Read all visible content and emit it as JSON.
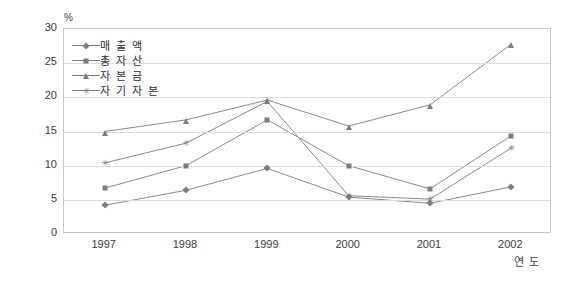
{
  "chart_data": {
    "type": "line",
    "title": "",
    "xlabel": "연도",
    "ylabel": "%",
    "unit_label": "%",
    "categories": [
      "1997",
      "1998",
      "1999",
      "2000",
      "2001",
      "2002"
    ],
    "ylim": [
      0,
      30
    ],
    "ytick_step": 5,
    "yticks": [
      "30",
      "25",
      "20",
      "15",
      "10",
      "5",
      "0"
    ],
    "grid": true,
    "legend_position": "top-left-inside",
    "series": [
      {
        "name": "매출액",
        "marker": "diamond",
        "color": "#7d7d7d",
        "values": [
          4.2,
          6.4,
          9.6,
          5.4,
          4.5,
          6.9
        ]
      },
      {
        "name": "총자산",
        "marker": "square",
        "color": "#7d7d7d",
        "values": [
          6.7,
          10.0,
          16.7,
          10.0,
          6.6,
          14.4
        ]
      },
      {
        "name": "자본금",
        "marker": "triangle",
        "color": "#7d7d7d",
        "values": [
          15.0,
          16.7,
          19.6,
          15.8,
          18.9,
          27.8
        ]
      },
      {
        "name": "자기자본",
        "marker": "star",
        "color": "#7d7d7d",
        "values": [
          10.4,
          13.3,
          19.4,
          5.6,
          5.1,
          12.6
        ]
      }
    ]
  },
  "legend": {
    "items": [
      {
        "label": "매 출 액"
      },
      {
        "label": "총 자 산"
      },
      {
        "label": "자 본 금"
      },
      {
        "label": "자 기 자 본"
      }
    ]
  },
  "axis": {
    "unit": "%",
    "x_title": "연 도"
  }
}
